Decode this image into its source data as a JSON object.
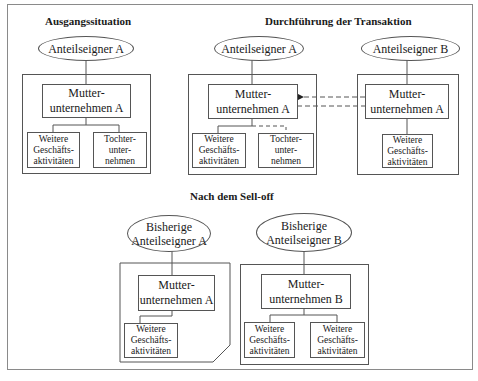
{
  "sections": {
    "initial": {
      "title": "Ausgangssituation",
      "shareholder": "Anteilseigner A",
      "parent": "Mutter-\nunternehmen A",
      "children": [
        "Weitere\nGeschäfts-\naktivitäten",
        "Tochter-\nunter-\nnehmen"
      ]
    },
    "transaction": {
      "title": "Durchführung der Transaktion",
      "seller": {
        "shareholder": "Anteilseigner A",
        "parent": "Mutter-\nunternehmen A",
        "children": [
          "Weitere\nGeschäfts-\naktivitäten",
          "Tochter-\nunter-\nnehmen"
        ]
      },
      "buyer": {
        "shareholder": "Anteilseigner B",
        "parent": "Mutter-\nunternehmen A",
        "children": [
          "Weitere\nGeschäfts-\naktivitäten"
        ]
      },
      "flow": "dashed arrows between buyer parent and seller parent; dashed link from seller parent to subsidiary"
    },
    "after": {
      "title": "Nach dem Sell-off",
      "left": {
        "shareholder": "Bisherige\nAnteilseigner A",
        "parent": "Mutter-\nunternehmen A",
        "children": [
          "Weitere\nGeschäfts-\naktivitäten"
        ]
      },
      "right": {
        "shareholder": "Bisherige\nAnteilseigner B",
        "parent": "Mutter-\nunternehmen B",
        "children": [
          "Weitere\nGeschäfts-\naktivitäten",
          "Weitere\nGeschäfts-\naktivitäten"
        ]
      }
    }
  },
  "colors": {
    "line": "#555555",
    "frame": "#8a8a8a"
  }
}
